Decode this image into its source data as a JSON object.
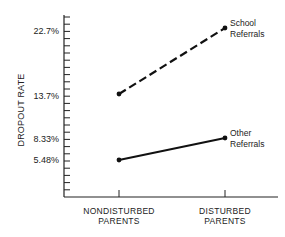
{
  "chart_data": {
    "type": "line",
    "title": "",
    "xlabel": "",
    "ylabel": "DROPOUT RATE",
    "categories": [
      "NONDISTURBED PARENTS",
      "DISTURBED PARENTS"
    ],
    "category_lines": [
      [
        "NONDISTURBED",
        "PARENTS"
      ],
      [
        "DISTURBED",
        "PARENTS"
      ]
    ],
    "y_tick_labels": [
      "22.7%",
      "13.7%",
      "8.33%",
      "5.48%"
    ],
    "y_tick_values": [
      22.7,
      13.7,
      8.33,
      5.48
    ],
    "grid": false,
    "legend_position": "inline-right",
    "series": [
      {
        "name": "School Referrals",
        "label_lines": [
          "School",
          "Referrals"
        ],
        "style": "dashed",
        "values": [
          13.7,
          22.7
        ]
      },
      {
        "name": "Other Referrals",
        "label_lines": [
          "Other",
          "Referrals"
        ],
        "style": "solid",
        "values": [
          5.48,
          8.33
        ]
      }
    ]
  }
}
